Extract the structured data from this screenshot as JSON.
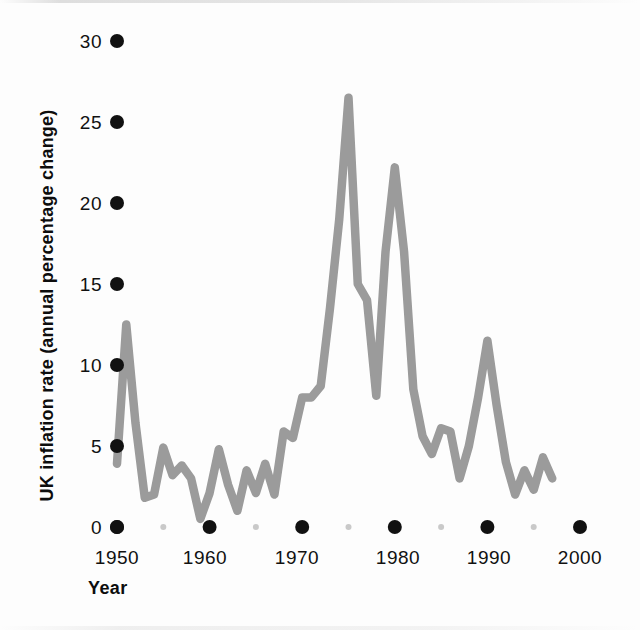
{
  "chart_data": {
    "type": "line",
    "title": "",
    "subtitle": "",
    "xlabel": "Year",
    "ylabel": "UK inflation rate (annual percentage change)",
    "xlim": [
      1949,
      2001
    ],
    "ylim": [
      0,
      31
    ],
    "grid": false,
    "legend": null,
    "line_color": "#9b9b9b",
    "tick_marker_color": "#111111",
    "minor_tick_marker_color": "#c9c9c9",
    "x_ticks": [
      1950,
      1960,
      1970,
      1980,
      1990,
      2000
    ],
    "x_minor_ticks": [
      1955,
      1965,
      1975,
      1985,
      1995
    ],
    "y_ticks": [
      0,
      5,
      10,
      15,
      20,
      25,
      30
    ],
    "series": [
      {
        "name": "UK inflation rate",
        "x": [
          1950,
          1951,
          1952,
          1953,
          1954,
          1955,
          1956,
          1957,
          1958,
          1959,
          1960,
          1961,
          1962,
          1963,
          1964,
          1965,
          1966,
          1967,
          1968,
          1969,
          1970,
          1971,
          1972,
          1973,
          1974,
          1975,
          1976,
          1977,
          1978,
          1979,
          1980,
          1981,
          1982,
          1983,
          1984,
          1985,
          1986,
          1987,
          1988,
          1989,
          1990,
          1991,
          1992,
          1993,
          1994,
          1995,
          1996,
          1997
        ],
        "values": [
          3.9,
          12.5,
          6.4,
          1.8,
          2.0,
          4.9,
          3.2,
          3.8,
          3.0,
          0.5,
          2.1,
          4.8,
          2.6,
          1.0,
          3.5,
          2.1,
          3.9,
          2.0,
          5.9,
          5.5,
          8.0,
          8.0,
          8.7,
          13.5,
          19.0,
          26.5,
          15.0,
          14.0,
          8.1,
          17.0,
          22.2,
          17.0,
          8.5,
          5.6,
          4.5,
          6.1,
          5.9,
          3.0,
          5.0,
          8.0,
          11.5,
          7.5,
          4.0,
          2.0,
          3.5,
          2.3,
          4.3,
          3.0
        ]
      }
    ]
  },
  "axes": {
    "y_tick_labels": [
      "30",
      "25",
      "20",
      "15",
      "10",
      "5",
      "0"
    ],
    "x_tick_labels": [
      "1950",
      "1960",
      "1970",
      "1980",
      "1990",
      "2000"
    ],
    "y_axis_title": "UK inflation rate (annual percentage change)",
    "x_axis_title": "Year"
  },
  "icons": {
    "major_tick_marker": "filled-circle",
    "minor_tick_marker": "small-faint-circle"
  }
}
